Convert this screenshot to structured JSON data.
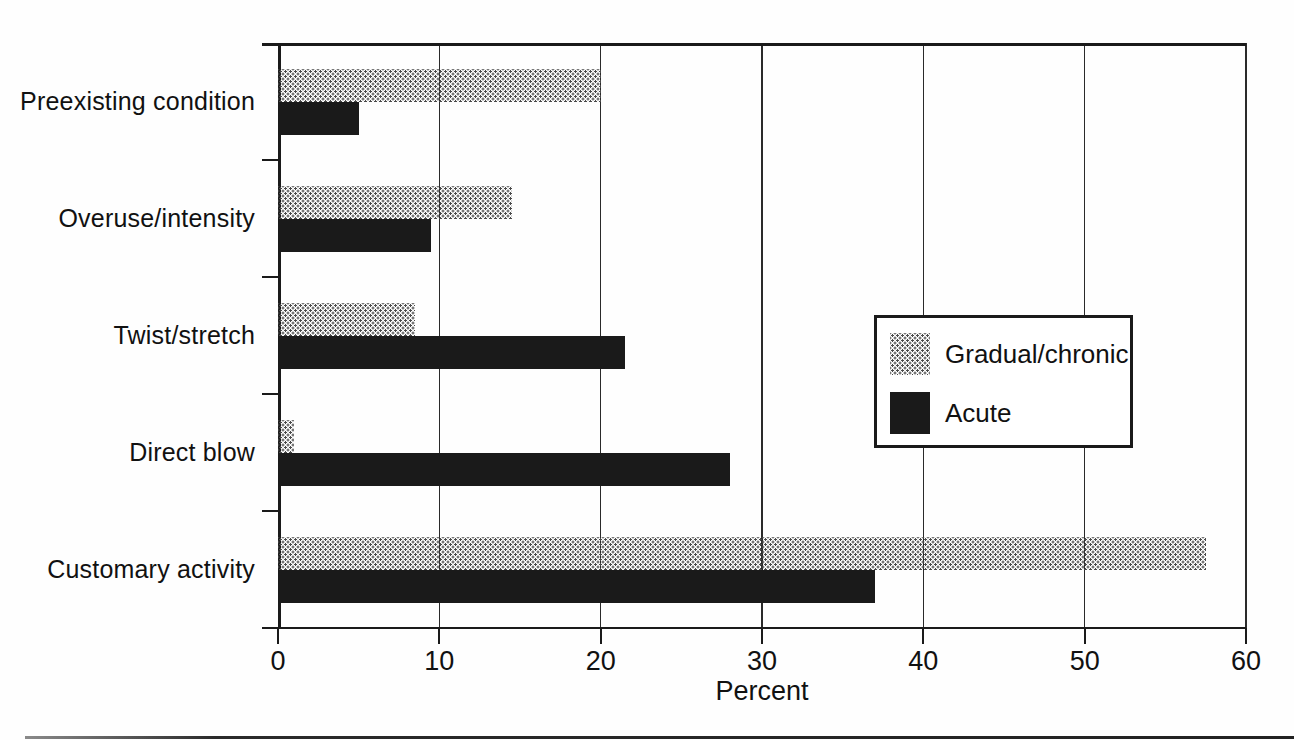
{
  "chart_data": {
    "type": "bar",
    "orientation": "horizontal",
    "title": "",
    "xlabel": "Percent",
    "ylabel": "",
    "xlim": [
      0,
      60
    ],
    "xticks": [
      0,
      10,
      20,
      30,
      40,
      50,
      60
    ],
    "xtick_labels": [
      "0",
      "10",
      "20",
      "30",
      "40",
      "50",
      "60"
    ],
    "grid": "vertical",
    "legend_position": "middle-right",
    "categories": [
      "Preexisting condition",
      "Overuse/intensity",
      "Twist/stretch",
      "Direct blow",
      "Customary activity"
    ],
    "series": [
      {
        "name": "Gradual/chronic",
        "style": "stipple",
        "values": [
          20,
          14.5,
          8.5,
          1,
          57.5
        ]
      },
      {
        "name": "Acute",
        "style": "solid-black",
        "values": [
          5,
          9.5,
          21.5,
          28,
          37
        ]
      }
    ],
    "colors": {
      "acute_fill": "#1a1a1a",
      "stipple_dot": "#4a4a4a",
      "line": "#1a1a1a",
      "background": "#ffffff"
    }
  }
}
